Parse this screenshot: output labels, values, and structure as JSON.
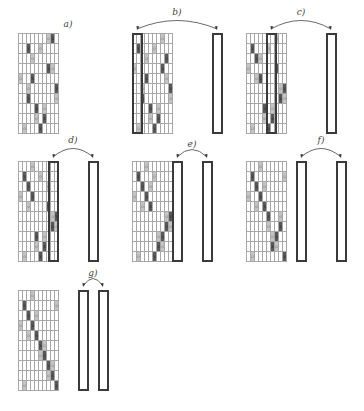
{
  "colors": {
    "X": "#595959",
    "O": "#c4c4c4",
    "empty": "#ffffff",
    "grid_line": "#a8a8a8",
    "highlight_border": "#3a3a3a"
  },
  "panels": [
    {
      "label": "a)",
      "x": 18,
      "y": 33,
      "swap": null,
      "cells": [
        [
          7,
          "O"
        ],
        [
          8,
          "X"
        ]
      ]
    },
    {
      "label": "b)",
      "x": 132,
      "y": 33,
      "swap": [
        0,
        8
      ]
    },
    {
      "label": "c)",
      "x": 246,
      "y": 33,
      "swap": [
        2,
        8
      ]
    },
    {
      "label": "d)",
      "x": 18,
      "y": 161,
      "swap": [
        3,
        7
      ]
    },
    {
      "label": "e)",
      "x": 132,
      "y": 161,
      "swap": [
        4,
        7
      ]
    },
    {
      "label": "f)",
      "x": 246,
      "y": 161,
      "swap": [
        5,
        9
      ]
    },
    {
      "label": "g)",
      "x": 18,
      "y": 290,
      "swap": [
        6,
        8
      ]
    }
  ],
  "grids": {
    "a": [
      [
        "7O",
        "8X"
      ],
      [
        "2X",
        "5O"
      ],
      [
        "0X",
        "3O"
      ],
      [
        "7X",
        "8O"
      ],
      [
        "0O",
        "3X"
      ],
      [
        "2O",
        "9X"
      ],
      [
        "2X",
        "9O"
      ],
      [
        "4X",
        "6O"
      ],
      [
        "4O",
        "6X"
      ],
      [
        "1O",
        "5X"
      ]
    ],
    "b": [
      [
        "0X",
        "7O"
      ],
      [
        "1X",
        "5O"
      ],
      [
        "3O",
        "8X"
      ],
      [
        "0O",
        "7X"
      ],
      [
        "3X",
        "8O"
      ],
      [
        "2O",
        "9X"
      ],
      [
        "2X",
        "9O"
      ],
      [
        "4X",
        "6O"
      ],
      [
        "4O",
        "6X"
      ],
      [
        "1O",
        "5X"
      ]
    ],
    "c": [
      [
        "0X",
        "7O"
      ],
      [
        "1X",
        "5O"
      ],
      [
        "2X",
        "3O"
      ],
      [
        "0O",
        "7X"
      ],
      [
        "2O",
        "3X"
      ],
      [
        "8O",
        "9X"
      ],
      [
        "8X",
        "9O"
      ],
      [
        "4X",
        "6O"
      ],
      [
        "4O",
        "6X"
      ],
      [
        "1O",
        "5X"
      ]
    ],
    "d": [
      [
        "0X",
        "3O"
      ],
      [
        "1X",
        "5O"
      ],
      [
        "2X",
        "7O"
      ],
      [
        "0O",
        "3X"
      ],
      [
        "2O",
        "7X"
      ],
      [
        "8O",
        "9X"
      ],
      [
        "8X",
        "9O"
      ],
      [
        "4X",
        "6O"
      ],
      [
        "4O",
        "6X"
      ],
      [
        "1O",
        "5X"
      ]
    ],
    "e": [
      [
        "0X",
        "3O"
      ],
      [
        "1X",
        "5O"
      ],
      [
        "2X",
        "4O"
      ],
      [
        "0O",
        "3X"
      ],
      [
        "2O",
        "4X"
      ],
      [
        "8O",
        "9X"
      ],
      [
        "8X",
        "9O"
      ],
      [
        "6O",
        "7X"
      ],
      [
        "6X",
        "7O"
      ],
      [
        "1O",
        "5X"
      ]
    ],
    "f": [
      [
        "0X",
        "3O"
      ],
      [
        "1X",
        "9O"
      ],
      [
        "2X",
        "4O"
      ],
      [
        "0O",
        "3X"
      ],
      [
        "2O",
        "4X"
      ],
      [
        "5X",
        "8O"
      ],
      [
        "5O",
        "8X"
      ],
      [
        "6O",
        "7X"
      ],
      [
        "6X",
        "7O"
      ],
      [
        "1O",
        "9X"
      ]
    ],
    "g": [
      [
        "0X",
        "3O"
      ],
      [
        "1X",
        "9O"
      ],
      [
        "2X",
        "4O"
      ],
      [
        "0O",
        "3X"
      ],
      [
        "2O",
        "4X"
      ],
      [
        "5X",
        "6O"
      ],
      [
        "5O",
        "6X"
      ],
      [
        "7X",
        "8O"
      ],
      [
        "7O",
        "8X"
      ],
      [
        "1O",
        "9X"
      ]
    ]
  },
  "symbols": {
    "X": "x",
    "O": "o"
  }
}
